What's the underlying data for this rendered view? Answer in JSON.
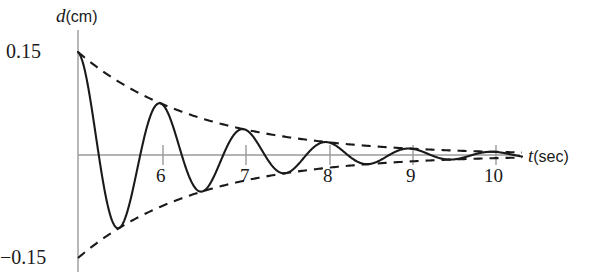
{
  "chart_data": {
    "type": "line",
    "title": "",
    "xlabel": "t (sec)",
    "xlabel_var": "t",
    "xlabel_unit": "(sec)",
    "ylabel": "d (cm)",
    "ylabel_var": "d",
    "ylabel_unit": "(cm)",
    "xlim": [
      5.0,
      10.35
    ],
    "ylim": [
      -0.155,
      0.155
    ],
    "grid": false,
    "legend": null,
    "x_ticks": [
      6,
      7,
      8,
      9,
      10
    ],
    "x_tick_labels": [
      "6",
      "7",
      "8",
      "9",
      "10"
    ],
    "y_ticks": [
      0.15,
      -0.15
    ],
    "y_tick_labels": [
      "0.15",
      "-0.15"
    ],
    "y_top_label": "0.15",
    "y_bottom_label": "−0.15",
    "axis_color": "#9a9a9a",
    "curve_color": "#1a1a1a",
    "envelope_color": "#1a1a1a",
    "envelope_style": "dashed",
    "model": {
      "equation": "d(t) = 0.15 * exp(-k*(t-5)) * cos(2*pi*(t-5))",
      "amplitude_initial": 0.15,
      "decay_per_second": 0.5,
      "period_sec": 1.0,
      "phase": "cosine (maximum at t=5)",
      "t_start": 5.0,
      "t_end": 10.35
    },
    "series": [
      {
        "name": "displacement",
        "style": "solid",
        "t": [
          5.0,
          5.25,
          5.5,
          5.75,
          6.0,
          6.25,
          6.5,
          6.75,
          7.0,
          7.25,
          7.5,
          7.75,
          8.0,
          8.25,
          8.5,
          8.75,
          9.0,
          9.25,
          9.5,
          9.75,
          10.0,
          10.25
        ],
        "d": [
          0.15,
          0.0,
          -0.1061,
          0.0,
          0.075,
          0.0,
          -0.053,
          0.0,
          0.0375,
          0.0,
          -0.0265,
          0.0,
          0.0188,
          0.0,
          -0.0133,
          0.0,
          0.0094,
          0.0,
          -0.0066,
          0.0,
          0.0047,
          0.0
        ]
      },
      {
        "name": "upper-envelope",
        "style": "dashed",
        "t": [
          5.0,
          6.0,
          7.0,
          8.0,
          9.0,
          10.0,
          10.35
        ],
        "d": [
          0.15,
          0.075,
          0.0375,
          0.0188,
          0.0094,
          0.0047,
          0.0037
        ]
      },
      {
        "name": "lower-envelope",
        "style": "dashed",
        "t": [
          5.0,
          6.0,
          7.0,
          8.0,
          9.0,
          10.0,
          10.35
        ],
        "d": [
          -0.15,
          -0.075,
          -0.0375,
          -0.0188,
          -0.0094,
          -0.0047,
          -0.0037
        ]
      }
    ],
    "peaks": [
      {
        "t": 6.0,
        "d": 0.075
      },
      {
        "t": 7.0,
        "d": 0.0375
      },
      {
        "t": 8.0,
        "d": 0.0188
      },
      {
        "t": 9.0,
        "d": 0.0094
      },
      {
        "t": 10.0,
        "d": 0.0047
      }
    ],
    "troughs": [
      {
        "t": 5.5,
        "d": -0.1061
      },
      {
        "t": 6.5,
        "d": -0.053
      },
      {
        "t": 7.5,
        "d": -0.0265
      },
      {
        "t": 8.5,
        "d": -0.0133
      },
      {
        "t": 9.5,
        "d": -0.0066
      }
    ]
  }
}
